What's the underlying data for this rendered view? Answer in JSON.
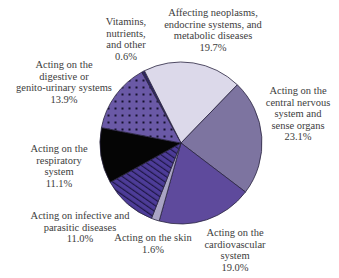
{
  "chart_data": {
    "type": "pie",
    "title": "",
    "start_angle_deg": -29,
    "direction": "clockwise",
    "slices": [
      {
        "key": "vitamins",
        "label": "Vitamins, nutrients, and other",
        "value": 0.6,
        "value_label": "0.6%",
        "color": "#2e2660",
        "pattern": "solid"
      },
      {
        "key": "neoplasms",
        "label": "Affecting neoplasms, endocrine systems, and metabolic diseases",
        "value": 19.7,
        "value_label": "19.7%",
        "color": "#dcd9ea",
        "pattern": "solid"
      },
      {
        "key": "cns",
        "label": "Acting on the central nervous system and sense organs",
        "value": 23.1,
        "value_label": "23.1%",
        "color": "#7d74a0",
        "pattern": "solid"
      },
      {
        "key": "cardio",
        "label": "Acting on the cardiovascular system",
        "value": 19.0,
        "value_label": "19.0%",
        "color": "#5e4a9c",
        "pattern": "solid"
      },
      {
        "key": "skin",
        "label": "Acting on the skin",
        "value": 1.6,
        "value_label": "1.6%",
        "color": "#a9a4c4",
        "pattern": "solid"
      },
      {
        "key": "infective",
        "label": "Acting on infective and parasitic diseases",
        "value": 11.0,
        "value_label": "11.0%",
        "color": "#4b3a94",
        "pattern": "stripes"
      },
      {
        "key": "respiratory",
        "label": "Acting on the respiratory system",
        "value": 11.1,
        "value_label": "11.1%",
        "color": "#050505",
        "pattern": "solid"
      },
      {
        "key": "digestive",
        "label": "Acting on the digestive or genito-urinary systems",
        "value": 13.9,
        "value_label": "13.9%",
        "color": "#6a59a6",
        "pattern": "dots"
      }
    ],
    "legend": "none (direct labels)"
  },
  "labels": {
    "vitamins": {
      "lines": [
        "Vitamins,",
        "nutrients,",
        "and other"
      ],
      "pct": "0.6%"
    },
    "neoplasms": {
      "lines": [
        "Affecting neoplasms,",
        "endocrine systems, and",
        "metabolic diseases"
      ],
      "pct": "19.7%"
    },
    "cns": {
      "lines": [
        "Acting on the",
        "central nervous",
        "system and",
        "sense organs"
      ],
      "pct": "23.1%"
    },
    "cardio": {
      "lines": [
        "Acting on the",
        "cardiovascular",
        "system"
      ],
      "pct": "19.0%"
    },
    "skin": {
      "lines": [
        "Acting on the skin"
      ],
      "pct": "1.6%"
    },
    "infective": {
      "lines": [
        "Acting on infective and",
        "parasitic diseases"
      ],
      "pct": "11.0%"
    },
    "respiratory": {
      "lines": [
        "Acting on the",
        "respiratory",
        "system"
      ],
      "pct": "11.1%"
    },
    "digestive": {
      "lines": [
        "Acting on the",
        "digestive or",
        "genito-urinary systems"
      ],
      "pct": "13.9%"
    }
  }
}
